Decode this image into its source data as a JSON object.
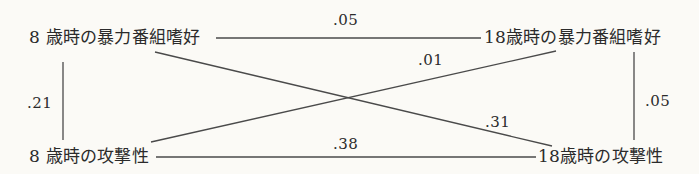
{
  "diagram": {
    "type": "cross-lagged-panel",
    "nodes": {
      "top_left": "8 歳時の暴力番組嗜好",
      "top_right": "18歳時の暴力番組嗜好",
      "bottom_left": "8 歳時の攻撃性",
      "bottom_right": "18歳時の攻撃性"
    },
    "paths": {
      "top_horizontal": ".05",
      "bottom_horizontal": ".38",
      "left_vertical": ".21",
      "right_vertical": ".05",
      "diag_bl_to_tr": ".01",
      "diag_tl_to_br": ".31"
    },
    "colors": {
      "background": "#fbfaf6",
      "line": "#4a4a4a",
      "text": "#2b2b2b"
    }
  }
}
